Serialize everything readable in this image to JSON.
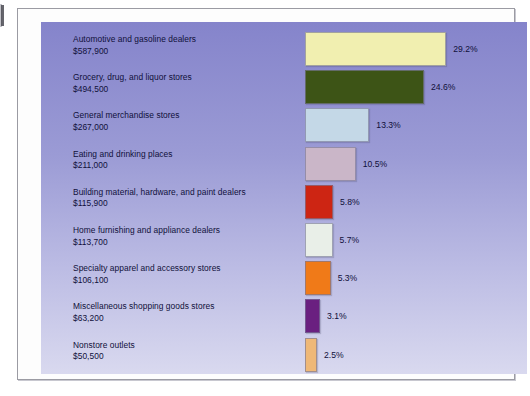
{
  "chart_data": {
    "type": "bar",
    "orientation": "horizontal",
    "title": "",
    "subtitle": "",
    "xlabel": "",
    "ylabel": "",
    "grid": false,
    "legend": false,
    "value_suffix": "%",
    "categories": [
      "Automotive and gasoline dealers",
      "Grocery, drug, and liquor stores",
      "General merchandise stores",
      "Eating and drinking places",
      "Building material, hardware, and paint dealers",
      "Home furnishing and appliance dealers",
      "Specialty apparel and accessory stores",
      "Miscellaneous shopping goods stores",
      "Nonstore outlets"
    ],
    "values": [
      29.2,
      24.6,
      13.3,
      10.5,
      5.8,
      5.7,
      5.3,
      3.1,
      2.5
    ],
    "value_labels": [
      "29.2%",
      "24.6%",
      "13.3%",
      "10.5%",
      "5.8%",
      "5.7%",
      "5.3%",
      "3.1%",
      "2.5%"
    ],
    "amounts": [
      "$587,900",
      "$494,500",
      "$267,000",
      "$211,000",
      "$115,900",
      "$113,700",
      "$106,100",
      "$63,200",
      "$50,500"
    ],
    "amount_values": [
      587900,
      494500,
      267000,
      211000,
      115900,
      113700,
      106100,
      63200,
      50500
    ],
    "xlim": [
      0,
      30
    ],
    "bar_colors": [
      "#f1efb0",
      "#3d5416",
      "#c4d8e7",
      "#cab6c8",
      "#cd2513",
      "#e9efe8",
      "#f07a18",
      "#6a2080",
      "#efb877"
    ]
  },
  "rows": [
    {
      "category": "Automotive and gasoline dealers",
      "amount": "$587,900",
      "percent": "29.2%"
    },
    {
      "category": "Grocery, drug, and liquor stores",
      "amount": "$494,500",
      "percent": "24.6%"
    },
    {
      "category": "General merchandise stores",
      "amount": "$267,000",
      "percent": "13.3%"
    },
    {
      "category": "Eating and drinking places",
      "amount": "$211,000",
      "percent": "10.5%"
    },
    {
      "category": "Building material, hardware, and paint dealers",
      "amount": "$115,900",
      "percent": "5.8%"
    },
    {
      "category": "Home furnishing and appliance dealers",
      "amount": "$113,700",
      "percent": "5.7%"
    },
    {
      "category": "Specialty apparel and accessory stores",
      "amount": "$106,100",
      "percent": "5.3%"
    },
    {
      "category": "Miscellaneous shopping goods stores",
      "amount": "$63,200",
      "percent": "3.1%"
    },
    {
      "category": "Nonstore outlets",
      "amount": "$50,500",
      "percent": "2.5%"
    }
  ],
  "theme": {
    "panel_gradient_top": "#8584cb",
    "panel_gradient_bottom": "#d9d9ef",
    "text_color": "#10103a",
    "page_background": "#ffffff",
    "frame_border": "#9b9ba3"
  }
}
